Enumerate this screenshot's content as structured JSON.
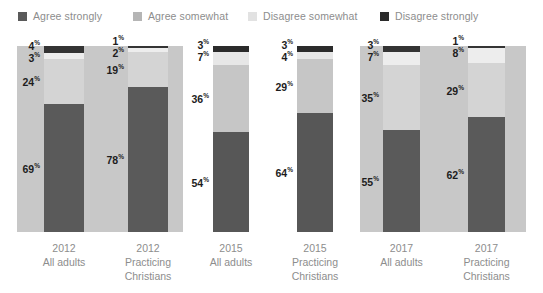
{
  "chart_data": {
    "type": "bar",
    "subtype": "stacked-100-percent",
    "title": "",
    "xlabel": "",
    "ylabel": "",
    "ylim": [
      0,
      100
    ],
    "grid": false,
    "legend_position": "top",
    "stack_order_bottom_to_top": [
      "Agree strongly",
      "Agree somewhat",
      "Disagree somewhat",
      "Disagree strongly"
    ],
    "categories": [
      "2012 All adults",
      "2012 Practicing Christians",
      "2015 All adults",
      "2015 Practicing Christians",
      "2017 All adults",
      "2017 Practicing Christians"
    ],
    "series": [
      {
        "name": "Agree strongly",
        "color": "#5a5a5a",
        "values": [
          69,
          78,
          54,
          64,
          55,
          62
        ]
      },
      {
        "name": "Agree somewhat",
        "color": "#b5b5b5",
        "values": [
          24,
          19,
          36,
          29,
          35,
          29
        ]
      },
      {
        "name": "Disagree somewhat",
        "color": "#e2e2e2",
        "values": [
          3,
          2,
          7,
          4,
          7,
          8
        ]
      },
      {
        "name": "Disagree strongly",
        "color": "#2b2b2b",
        "values": [
          4,
          1,
          3,
          3,
          3,
          1
        ]
      }
    ]
  },
  "legend": {
    "items": [
      {
        "label": "Agree strongly",
        "color": "#5a5a5a",
        "left": 18
      },
      {
        "label": "Agree somewhat",
        "color": "#b5b5b5",
        "left": 133
      },
      {
        "label": "Disagree somewhat",
        "color": "#e2e2e2",
        "left": 248
      },
      {
        "label": "Disagree strongly",
        "color": "#2b2b2b",
        "left": 380
      }
    ]
  },
  "panels": [
    {
      "year": "2012",
      "shaded": true,
      "left": 17,
      "width": 166
    },
    {
      "year": "2015",
      "shaded": false,
      "left": 190,
      "width": 166
    },
    {
      "year": "2017",
      "shaded": true,
      "left": 360,
      "width": 166
    }
  ],
  "bars": [
    {
      "group": "2012",
      "audience_line1": "2012",
      "audience_line2": "All adults",
      "audience_line3": "",
      "left": 44,
      "width": 40,
      "segments": [
        {
          "name": "Agree strongly",
          "value": "69",
          "suffix": "%",
          "color": "#5a5a5a",
          "pct": 69
        },
        {
          "name": "Agree somewhat",
          "value": "24",
          "suffix": "%",
          "color": "#d4d4d4",
          "pct": 24
        },
        {
          "name": "Disagree somewhat",
          "value": "3",
          "suffix": "%",
          "color": "#ededed",
          "pct": 3
        },
        {
          "name": "Disagree strongly",
          "value": "4",
          "suffix": "%",
          "color": "#343434",
          "pct": 4
        }
      ]
    },
    {
      "group": "2012",
      "audience_line1": "2012",
      "audience_line2": "Practicing",
      "audience_line3": "Christians",
      "left": 128,
      "width": 40,
      "segments": [
        {
          "name": "Agree strongly",
          "value": "78",
          "suffix": "%",
          "color": "#5a5a5a",
          "pct": 78
        },
        {
          "name": "Agree somewhat",
          "value": "19",
          "suffix": "%",
          "color": "#d4d4d4",
          "pct": 19
        },
        {
          "name": "Disagree somewhat",
          "value": "2",
          "suffix": "%",
          "color": "#ededed",
          "pct": 2
        },
        {
          "name": "Disagree strongly",
          "value": "1",
          "suffix": "%",
          "color": "#343434",
          "pct": 1
        }
      ]
    },
    {
      "group": "2015",
      "audience_line1": "2015",
      "audience_line2": "All adults",
      "audience_line3": "",
      "left": 213,
      "width": 36,
      "segments": [
        {
          "name": "Agree strongly",
          "value": "54",
          "suffix": "%",
          "color": "#575757",
          "pct": 54
        },
        {
          "name": "Agree somewhat",
          "value": "36",
          "suffix": "%",
          "color": "#c6c6c6",
          "pct": 36
        },
        {
          "name": "Disagree somewhat",
          "value": "7",
          "suffix": "%",
          "color": "#e7e7e7",
          "pct": 7
        },
        {
          "name": "Disagree strongly",
          "value": "3",
          "suffix": "%",
          "color": "#2b2b2b",
          "pct": 3
        }
      ]
    },
    {
      "group": "2015",
      "audience_line1": "2015",
      "audience_line2": "Practicing",
      "audience_line3": "Christians",
      "left": 297,
      "width": 36,
      "segments": [
        {
          "name": "Agree strongly",
          "value": "64",
          "suffix": "%",
          "color": "#575757",
          "pct": 64
        },
        {
          "name": "Agree somewhat",
          "value": "29",
          "suffix": "%",
          "color": "#c6c6c6",
          "pct": 29
        },
        {
          "name": "Disagree somewhat",
          "value": "4",
          "suffix": "%",
          "color": "#e7e7e7",
          "pct": 4
        },
        {
          "name": "Disagree strongly",
          "value": "3",
          "suffix": "%",
          "color": "#2b2b2b",
          "pct": 3
        }
      ]
    },
    {
      "group": "2017",
      "audience_line1": "2017",
      "audience_line2": "All adults",
      "audience_line3": "",
      "left": 383,
      "width": 37,
      "segments": [
        {
          "name": "Agree strongly",
          "value": "55",
          "suffix": "%",
          "color": "#5a5a5a",
          "pct": 55
        },
        {
          "name": "Agree somewhat",
          "value": "35",
          "suffix": "%",
          "color": "#d4d4d4",
          "pct": 35
        },
        {
          "name": "Disagree somewhat",
          "value": "7",
          "suffix": "%",
          "color": "#ededed",
          "pct": 7
        },
        {
          "name": "Disagree strongly",
          "value": "3",
          "suffix": "%",
          "color": "#343434",
          "pct": 3
        }
      ]
    },
    {
      "group": "2017",
      "audience_line1": "2017",
      "audience_line2": "Practicing",
      "audience_line3": "Christians",
      "left": 468,
      "width": 37,
      "segments": [
        {
          "name": "Agree strongly",
          "value": "62",
          "suffix": "%",
          "color": "#5a5a5a",
          "pct": 62
        },
        {
          "name": "Agree somewhat",
          "value": "29",
          "suffix": "%",
          "color": "#d4d4d4",
          "pct": 29
        },
        {
          "name": "Disagree somewhat",
          "value": "8",
          "suffix": "%",
          "color": "#ededed",
          "pct": 8
        },
        {
          "name": "Disagree strongly",
          "value": "1",
          "suffix": "%",
          "color": "#343434",
          "pct": 1
        }
      ]
    }
  ]
}
